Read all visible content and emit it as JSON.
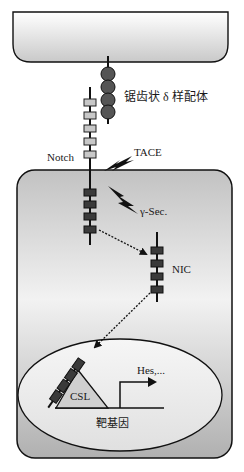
{
  "diagram": {
    "labels": {
      "ligand": "锯齿状 δ 样配体",
      "notch": "Notch",
      "tace": "TACE",
      "gamma_sec": "γ-Sec.",
      "nic": "NIC",
      "csl": "CSL",
      "hes": "Hes,...",
      "target_gene": "靶基因"
    },
    "colors": {
      "outline": "#111111",
      "cell_fill_light": "#f4f4f4",
      "cell_fill_dark": "#bdbdbd",
      "domain_dark": "#3a3a3a",
      "domain_light": "#c8c8c8",
      "csl_fill": "#cfcfcf"
    }
  }
}
